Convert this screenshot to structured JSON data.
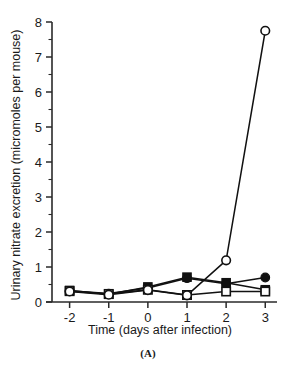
{
  "figure": {
    "panel_label": "(A)"
  },
  "chart_data": {
    "type": "line",
    "title": "",
    "xlabel": "Time (days after infection)",
    "ylabel": "Urinary nitrate excretion (micromoles per mouse)",
    "x": [
      -2,
      -1,
      0,
      1,
      2,
      3
    ],
    "xticklabels": [
      "-2",
      "-1",
      "0",
      "1",
      "2",
      "3"
    ],
    "yticklabels": [
      "0",
      "1",
      "2",
      "3",
      "4",
      "5",
      "6",
      "7",
      "8"
    ],
    "xlim": [
      -2.45,
      3.3
    ],
    "ylim": [
      0,
      8
    ],
    "y_minor_ticks": [
      0.5,
      1.5,
      2.5,
      3.5,
      4.5,
      5.5,
      6.5,
      7.5
    ],
    "grid": false,
    "legend_position": "none",
    "series": [
      {
        "name": "filled-square",
        "marker": "filled-square",
        "values": [
          0.33,
          0.22,
          0.43,
          0.71,
          0.55,
          0.35
        ]
      },
      {
        "name": "filled-circle",
        "marker": "filled-circle",
        "values": [
          0.32,
          0.24,
          0.4,
          0.68,
          0.52,
          0.7
        ]
      },
      {
        "name": "open-square",
        "marker": "open-square",
        "values": [
          0.31,
          0.23,
          0.35,
          0.2,
          0.3,
          0.3
        ]
      },
      {
        "name": "open-circle",
        "marker": "open-circle",
        "values": [
          0.3,
          0.21,
          0.34,
          0.19,
          1.19,
          7.75
        ]
      }
    ]
  }
}
